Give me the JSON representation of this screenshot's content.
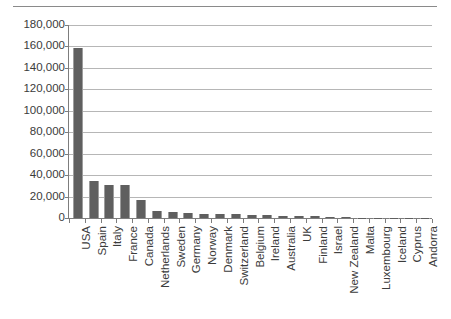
{
  "chart_data": {
    "type": "bar",
    "title": "",
    "subtitle": "",
    "xlabel": "",
    "ylabel": "",
    "ylim": [
      0,
      180000
    ],
    "ytick_labels": [
      "180,000",
      "160,000",
      "140,000",
      "120,000",
      "100,000",
      "80,000",
      "60,000",
      "40,000",
      "20,000",
      "0"
    ],
    "ytick_values": [
      180000,
      160000,
      140000,
      120000,
      100000,
      80000,
      60000,
      40000,
      20000,
      0
    ],
    "grid": true,
    "legend": null,
    "legend_position": "none",
    "orientation": "vertical",
    "bar_color": "#5f5f5f",
    "gridline_color": "#b6b6b6",
    "axis_color": "#7d7d7d",
    "categories": [
      "USA",
      "Spain",
      "Italy",
      "France",
      "Canada",
      "Netherlands",
      "Sweden",
      "Germany",
      "Norway",
      "Denmark",
      "Switzerland",
      "Belgium",
      "Ireland",
      "Australia",
      "UK",
      "Finland",
      "Israel",
      "New Zealand",
      "Malta",
      "Luxembourg",
      "Iceland",
      "Cyprus",
      "Andorra"
    ],
    "values": [
      159000,
      34500,
      31000,
      31000,
      17000,
      6200,
      6000,
      4600,
      4200,
      3800,
      3600,
      3200,
      2800,
      2200,
      2000,
      1500,
      900,
      600,
      400,
      300,
      250,
      150,
      100
    ]
  }
}
